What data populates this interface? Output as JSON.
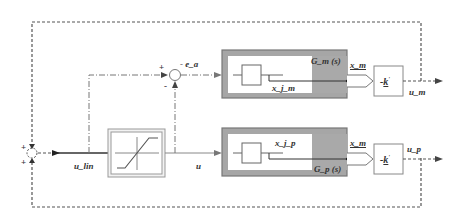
{
  "diagram": {
    "type": "block-diagram",
    "title": "",
    "blocks": {
      "model_plant": {
        "label": "G_m (s)",
        "inner_state": "x_j_m",
        "output": "x_m"
      },
      "real_plant": {
        "label": "G_p (s)",
        "inner_state": "x_j_p",
        "output": "x_m"
      },
      "saturation": {
        "label": "saturation"
      },
      "gain_top": {
        "label_prefix": "-",
        "label_gain": "k",
        "label_suffix": "'"
      },
      "gain_bottom": {
        "label_prefix": "-",
        "label_gain": "k",
        "label_suffix": "'"
      }
    },
    "signals": {
      "error": "- e_a",
      "u_lin": "u_lin",
      "u": "u",
      "u_m": "u_m",
      "u_p": "u_p"
    },
    "summation_top": {
      "plus": "+",
      "minus": "-"
    },
    "summation_left": {
      "plus_top": "+",
      "plus_bottom": "+"
    },
    "colors": {
      "block_gray": "#8a8a8a",
      "block_shade": "#a8a8a8",
      "line": "#444444",
      "line_light": "#888888"
    }
  }
}
